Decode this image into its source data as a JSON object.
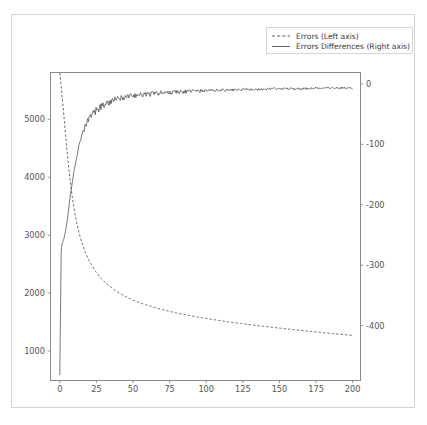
{
  "figure": {
    "background_color": "#ffffff",
    "border_color": "#d4d4d4",
    "axis_color": "#8a8a8a",
    "line_color": "#4d4d4d"
  },
  "legend": {
    "position": "upper-right-outside",
    "entries": [
      {
        "label": "Errors (Left axis)",
        "style": "dashed",
        "axis": "left"
      },
      {
        "label": "Errors Differences (Right axis)",
        "style": "solid",
        "axis": "right"
      }
    ]
  },
  "chart_data": {
    "type": "line",
    "title": "",
    "xlabel": "",
    "ylabel": "",
    "grid": false,
    "xlim": [
      -6,
      205
    ],
    "xticks": [
      0,
      25,
      50,
      75,
      100,
      125,
      150,
      175,
      200
    ],
    "xticklabels": [
      "0",
      "25",
      "50",
      "75",
      "100",
      "125",
      "150",
      "175",
      "200"
    ],
    "left_axis": {
      "label": "Errors",
      "ylim": [
        500,
        5800
      ],
      "yticks": [
        1000,
        2000,
        3000,
        4000,
        5000
      ],
      "yticklabels": [
        "1000",
        "2000",
        "3000",
        "4000",
        "5000"
      ]
    },
    "right_axis": {
      "label": "Errors Differences",
      "ylim": [
        -490,
        18
      ],
      "yticks": [
        0,
        -100,
        -200,
        -300,
        -400
      ],
      "yticklabels": [
        "0",
        "-100",
        "-200",
        "-300",
        "-400"
      ]
    },
    "series": [
      {
        "name": "Errors (Left axis)",
        "axis": "left",
        "style": "dashed",
        "x": [
          0,
          1,
          2,
          3,
          4,
          5,
          6,
          7,
          8,
          9,
          10,
          12,
          14,
          16,
          18,
          20,
          24,
          28,
          32,
          36,
          40,
          45,
          50,
          55,
          60,
          65,
          70,
          75,
          80,
          85,
          90,
          95,
          100,
          110,
          120,
          130,
          140,
          150,
          160,
          170,
          180,
          190,
          200
        ],
        "y": [
          5800,
          5560,
          5290,
          5010,
          4720,
          4450,
          4190,
          3960,
          3760,
          3580,
          3420,
          3160,
          2960,
          2800,
          2670,
          2560,
          2390,
          2260,
          2160,
          2080,
          2010,
          1940,
          1880,
          1830,
          1790,
          1750,
          1715,
          1685,
          1655,
          1630,
          1605,
          1583,
          1562,
          1523,
          1487,
          1455,
          1424,
          1396,
          1368,
          1342,
          1317,
          1293,
          1270
        ]
      },
      {
        "name": "Errors Differences (Right axis)",
        "axis": "right",
        "style": "solid",
        "x": [
          0,
          1,
          2,
          3,
          4,
          5,
          6,
          7,
          8,
          9,
          10,
          11,
          12,
          13,
          14,
          15,
          16,
          17,
          18,
          19,
          20,
          22,
          24,
          26,
          28,
          30,
          32,
          34,
          36,
          38,
          40,
          44,
          48,
          52,
          56,
          60,
          64,
          68,
          72,
          76,
          80,
          85,
          90,
          95,
          100,
          105,
          110,
          115,
          120,
          125,
          130,
          135,
          140,
          145,
          150,
          155,
          160,
          165,
          170,
          175,
          180,
          185,
          190,
          195,
          200
        ],
        "y": [
          -482,
          -268,
          -262,
          -255,
          -242,
          -228,
          -208,
          -188,
          -172,
          -155,
          -140,
          -128,
          -116,
          -104,
          -96,
          -88,
          -80,
          -74,
          -68,
          -63,
          -58,
          -51,
          -46,
          -42,
          -38,
          -35,
          -32,
          -30,
          -28,
          -26,
          -25,
          -22,
          -20,
          -19,
          -18,
          -17,
          -16,
          -15,
          -15,
          -14,
          -13,
          -13,
          -12,
          -12,
          -11,
          -11,
          -10,
          -10,
          -10,
          -9,
          -9,
          -9,
          -9,
          -8,
          -8,
          -8,
          -8,
          -8,
          -8,
          -7,
          -7,
          -7,
          -7,
          -7,
          -7
        ]
      }
    ],
    "noise": {
      "series": "Errors Differences (Right axis)",
      "description": "high-frequency oscillation, amplitude approximately 8 units",
      "amplitude": 8,
      "starts_at_x": 8
    }
  }
}
